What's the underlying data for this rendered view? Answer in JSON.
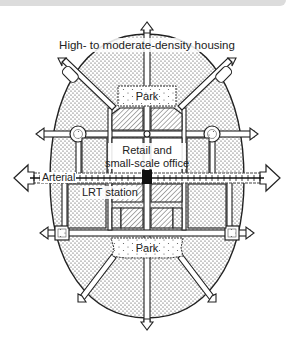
{
  "diagram": {
    "type": "transit-oriented development plan",
    "labels": {
      "housing": "High- to moderate-density housing",
      "park_top": "Park",
      "retail_line1": "Retail and",
      "retail_line2": "small-scale office",
      "arterial": "Arterial",
      "lrt_station": "LRT station",
      "park_bottom": "Park"
    },
    "legend_patterns": {
      "housing": "dotted",
      "retail_office": "diagonal-hatch",
      "park": "wavy-border-sparse-dots",
      "lrt_station": "solid-black-square"
    },
    "colors": {
      "ink": "#222222",
      "background": "#ffffff",
      "banner": "#dcdcdc"
    }
  }
}
